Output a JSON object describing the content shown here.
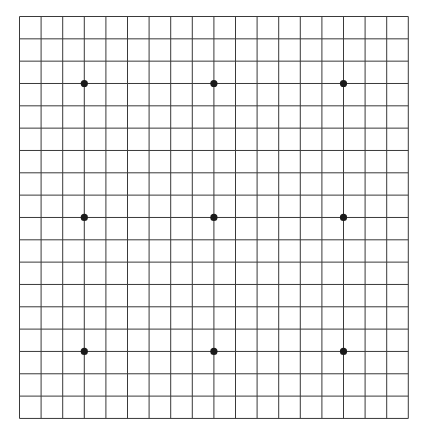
{
  "game": "Go",
  "board": {
    "size": 19,
    "background": "#ffffff",
    "line_color": "#3a3a3a",
    "star_color": "#1a1a1a",
    "origin_x": 19.5,
    "origin_y": 16.5,
    "spacing_x": 21.6,
    "spacing_y": 22.33,
    "star_points": [
      [
        3,
        3
      ],
      [
        9,
        3
      ],
      [
        15,
        3
      ],
      [
        3,
        9
      ],
      [
        9,
        9
      ],
      [
        15,
        9
      ],
      [
        3,
        15
      ],
      [
        9,
        15
      ],
      [
        15,
        15
      ]
    ],
    "stones": []
  }
}
